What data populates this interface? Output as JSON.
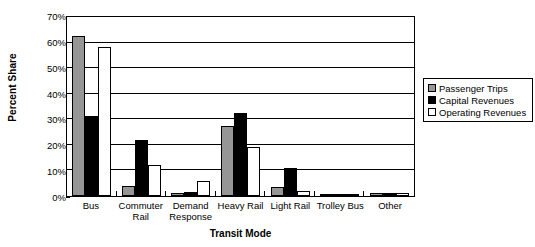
{
  "chart_data": {
    "type": "bar",
    "title": "",
    "xlabel": "Transit Mode",
    "ylabel": "Percent Share",
    "categories": [
      "Bus",
      "Commuter Rail",
      "Demand Response",
      "Heavy Rail",
      "Light Rail",
      "Trolley Bus",
      "Other"
    ],
    "category_lines": [
      [
        "Bus"
      ],
      [
        "Commuter",
        "Rail"
      ],
      [
        "Demand",
        "Response"
      ],
      [
        "Heavy Rail"
      ],
      [
        "Light Rail"
      ],
      [
        "Trolley Bus"
      ],
      [
        "Other"
      ]
    ],
    "series": [
      {
        "name": "Passenger Trips",
        "color": "#969696",
        "values": [
          62.0,
          4.0,
          1.0,
          27.0,
          3.5,
          0.8,
          1.0
        ]
      },
      {
        "name": "Capital Revenues",
        "color": "#000000",
        "values": [
          30.8,
          21.8,
          1.5,
          32.0,
          11.0,
          0.5,
          1.3
        ]
      },
      {
        "name": "Operating Revenues",
        "color": "#ffffff",
        "values": [
          57.5,
          12.0,
          6.0,
          19.0,
          2.0,
          0.6,
          1.2
        ]
      }
    ],
    "ylim": [
      0,
      70
    ],
    "yticks": [
      0,
      10,
      20,
      30,
      40,
      50,
      60,
      70
    ],
    "ytick_labels": [
      "0%",
      "10%",
      "20%",
      "30%",
      "40%",
      "50%",
      "60%",
      "70%"
    ],
    "grid": true,
    "legend_position": "right",
    "legend_entries": [
      "Passenger Trips",
      "Capital Revenues",
      "Operating Revenues"
    ]
  }
}
